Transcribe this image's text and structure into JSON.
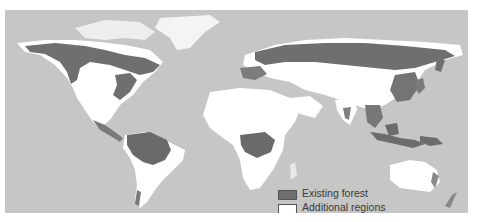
{
  "caption_partial": "",
  "map": {
    "title": "World forest cover",
    "colors": {
      "ocean": "#c6c6c6",
      "existing_forest": "#6f6f6f",
      "former_forest": "#ffffff",
      "other_land": "#dcdcdc"
    }
  },
  "legend": {
    "items": [
      {
        "label": "Existing forest",
        "swatch": "existing-forest"
      },
      {
        "label_line1": "Additional regions",
        "label_line2": "forested 8,000 years ago",
        "swatch": "former-forest"
      }
    ]
  }
}
